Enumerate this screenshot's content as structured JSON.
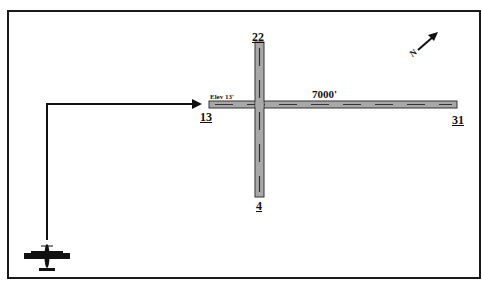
{
  "diagram": {
    "type": "airport-runway-diagram",
    "runways": [
      {
        "id": "13-31",
        "ends": [
          {
            "number": "13",
            "position": "west"
          },
          {
            "number": "31",
            "position": "east"
          }
        ],
        "length": "7000'",
        "elevation": "Elev 13'"
      },
      {
        "id": "4-22",
        "ends": [
          {
            "number": "22",
            "position": "north"
          },
          {
            "number": "4",
            "position": "south"
          }
        ]
      }
    ],
    "north_indicator": {
      "label": "N",
      "icon": "north-arrow-icon"
    },
    "aircraft": {
      "icon": "airplane-icon",
      "heading": "north"
    },
    "flight_path": {
      "description": "Aircraft flies north then turns east toward runway 13 threshold"
    },
    "colors": {
      "runway_fill": "#a8a8a8",
      "runway_outline": "#333333",
      "centerline": "#333333",
      "path": "#111111",
      "frame": "#1a1a1a"
    }
  }
}
